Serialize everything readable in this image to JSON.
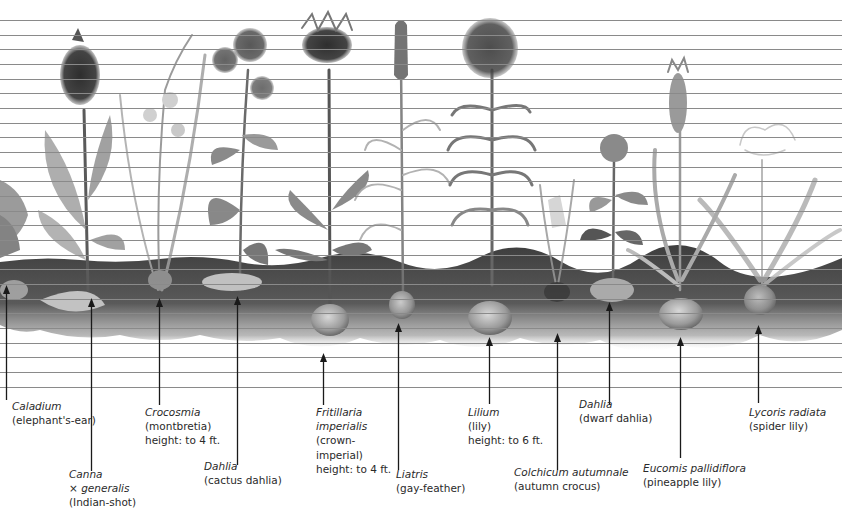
{
  "figure": {
    "ruled_lines": {
      "first_y": 20,
      "spacing": 14.66,
      "count": 26,
      "color": "#8a8a8a"
    },
    "soil": {
      "top_y": 257,
      "bottom_y": 350,
      "color": "#4a4a4a"
    },
    "arrow_color": "#1a1a1a"
  },
  "plants": [
    {
      "id": "caladium",
      "scientific": "Caladium",
      "common": "(elephant's-ear)",
      "height": "",
      "arrow_x": 6,
      "arrow_top": 285,
      "arrow_bottom": 400,
      "label_x": 12,
      "label_y": 399
    },
    {
      "id": "canna",
      "scientific": "Canna",
      "scientific2": "× generalis",
      "common": "(Indian-shot)",
      "height": "",
      "arrow_x": 91,
      "arrow_top": 298,
      "arrow_bottom": 471,
      "label_x": 69,
      "label_y": 467
    },
    {
      "id": "crocosmia",
      "scientific": "Crocosmia",
      "common": "(montbretia)",
      "height": "height: to 4 ft.",
      "arrow_x": 159,
      "arrow_top": 298,
      "arrow_bottom": 405,
      "label_x": 145,
      "label_y": 405
    },
    {
      "id": "dahlia-cactus",
      "scientific": "Dahlia",
      "common": "(cactus dahlia)",
      "height": "",
      "arrow_x": 237,
      "arrow_top": 296,
      "arrow_bottom": 465,
      "label_x": 204,
      "label_y": 459
    },
    {
      "id": "fritillaria",
      "scientific": "Fritillaria",
      "scientific2": "imperialis",
      "common": "(crown-",
      "common2": "imperial)",
      "height": "height: to 4 ft.",
      "arrow_x": 323,
      "arrow_top": 353,
      "arrow_bottom": 405,
      "label_x": 316,
      "label_y": 405
    },
    {
      "id": "liatris",
      "scientific": "Liatris",
      "common": "(gay-feather)",
      "height": "",
      "arrow_x": 398,
      "arrow_top": 323,
      "arrow_bottom": 470,
      "label_x": 396,
      "label_y": 467
    },
    {
      "id": "lilium",
      "scientific": "Lilium",
      "common": "(lily)",
      "height": "height: to 6 ft.",
      "arrow_x": 489,
      "arrow_top": 337,
      "arrow_bottom": 404,
      "label_x": 468,
      "label_y": 405
    },
    {
      "id": "colchicum",
      "scientific": "Colchicum autumnale",
      "common": "(autumn crocus)",
      "height": "",
      "arrow_x": 557,
      "arrow_top": 333,
      "arrow_bottom": 470,
      "label_x": 514,
      "label_y": 465
    },
    {
      "id": "dahlia-dwarf",
      "scientific": "Dahlia",
      "common": "(dwarf dahlia)",
      "height": "",
      "arrow_x": 609,
      "arrow_top": 302,
      "arrow_bottom": 405,
      "label_x": 579,
      "label_y": 397
    },
    {
      "id": "eucomis",
      "scientific": "Eucomis pallidiflora",
      "common": "(pineapple lily)",
      "height": "",
      "arrow_x": 680,
      "arrow_top": 337,
      "arrow_bottom": 458,
      "label_x": 643,
      "label_y": 461
    },
    {
      "id": "lycoris",
      "scientific": "Lycoris radiata",
      "common": "(spider lily)",
      "height": "",
      "arrow_x": 758,
      "arrow_top": 325,
      "arrow_bottom": 403,
      "label_x": 749,
      "label_y": 405
    }
  ]
}
